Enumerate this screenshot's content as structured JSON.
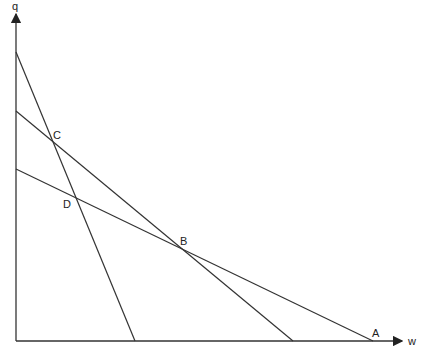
{
  "axes": {
    "y_label": "q",
    "x_label": "w",
    "origin": [
      16,
      341
    ],
    "x_end": [
      404,
      341
    ],
    "y_end": [
      16,
      12
    ]
  },
  "lines": [
    {
      "name": "steep-line",
      "from": [
        16,
        52
      ],
      "to": [
        135,
        341
      ]
    },
    {
      "name": "middle-line",
      "from": [
        16,
        111
      ],
      "to": [
        293,
        341
      ]
    },
    {
      "name": "shallow-line",
      "from": [
        16,
        169
      ],
      "to": [
        373,
        341
      ]
    }
  ],
  "points": [
    {
      "label": "A",
      "x": 376,
      "y": 336
    },
    {
      "label": "B",
      "x": 181,
      "y": 245
    },
    {
      "label": "C",
      "x": 54,
      "y": 139
    },
    {
      "label": "D",
      "x": 64,
      "y": 208
    }
  ],
  "colors": {
    "line": "#333333",
    "axis": "#333333"
  }
}
